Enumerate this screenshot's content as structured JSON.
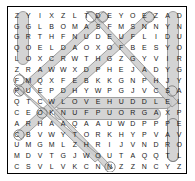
{
  "puzzle": {
    "type": "word-search",
    "rows": 15,
    "cols": 15,
    "grid": [
      [
        "Z",
        "Y",
        "I",
        "X",
        "Z",
        "L",
        "T",
        "D",
        "E",
        "Y",
        "O",
        "E",
        "Z",
        "A",
        "D"
      ],
      [
        "G",
        "G",
        "L",
        "B",
        "O",
        "M",
        "A",
        "S",
        "F",
        "M",
        "S",
        "N",
        "N",
        "Y",
        "N"
      ],
      [
        "G",
        "R",
        "T",
        "H",
        "F",
        "N",
        "U",
        "D",
        "E",
        "U",
        "F",
        "L",
        "I",
        "D",
        "U"
      ],
      [
        "Q",
        "O",
        "E",
        "L",
        "D",
        "A",
        "O",
        "X",
        "O",
        "F",
        "B",
        "E",
        "S",
        "Y",
        "O"
      ],
      [
        "L",
        "O",
        "X",
        "C",
        "R",
        "W",
        "T",
        "H",
        "G",
        "Z",
        "G",
        "Y",
        "V",
        "I",
        "R"
      ],
      [
        "Z",
        "R",
        "A",
        "W",
        "W",
        "X",
        "D",
        "P",
        "H",
        "E",
        "J",
        "A",
        "D",
        "Y",
        "G"
      ],
      [
        "F",
        "M",
        "Q",
        "X",
        "F",
        "E",
        "B",
        "K",
        "K",
        "G",
        "N",
        "P",
        "H",
        "J",
        "Y"
      ],
      [
        "P",
        "U",
        "E",
        "P",
        "D",
        "H",
        "Y",
        "W",
        "P",
        "G",
        "J",
        "V",
        "C",
        "S",
        "A"
      ],
      [
        "Q",
        "T",
        "C",
        "W",
        "L",
        "O",
        "V",
        "E",
        "H",
        "U",
        "D",
        "D",
        "L",
        "E",
        "L"
      ],
      [
        "C",
        "E",
        "O",
        "K",
        "N",
        "U",
        "F",
        "P",
        "U",
        "O",
        "R",
        "G",
        "A",
        "X",
        "P"
      ],
      [
        "A",
        "R",
        "H",
        "A",
        "A",
        "Q",
        "A",
        "A",
        "U",
        "W",
        "D",
        "P",
        "P",
        "P",
        "E"
      ],
      [
        "C",
        "B",
        "V",
        "W",
        "Y",
        "T",
        "O",
        "R",
        "K",
        "H",
        "Y",
        "P",
        "V",
        "A",
        "V"
      ],
      [
        "U",
        "M",
        "G",
        "M",
        "L",
        "Z",
        "H",
        "R",
        "I",
        "J",
        "V",
        "N",
        "D",
        "R",
        "O"
      ],
      [
        "M",
        "D",
        "V",
        "T",
        "G",
        "J",
        "W",
        "O",
        "U",
        "T",
        "A",
        "Q",
        "Q",
        "T",
        "L"
      ],
      [
        "C",
        "S",
        "V",
        "L",
        "V",
        "K",
        "C",
        "N",
        "N",
        "Z",
        "Z",
        "N",
        "C",
        "Y",
        "Z"
      ]
    ],
    "colors": {
      "highlight": "#c9c9c9",
      "highlight_stroke": "#8a8a8a",
      "letter": "#1a1a1a",
      "frame": "#000000",
      "background": "#ffffff"
    },
    "found_words": [
      {
        "word": "GROOVE",
        "direction": "down",
        "start_row": 0,
        "start_col": 1,
        "end_row": 4,
        "end_col": 1
      },
      {
        "word": "PLAYGROUND",
        "direction": "up",
        "start_row": 13,
        "start_col": 14,
        "end_row": 0,
        "end_col": 14
      },
      {
        "word": "LOVE",
        "direction": "up",
        "start_row": 13,
        "start_col": 14,
        "end_row": 10,
        "end_col": 14
      },
      {
        "word": "LOVE HUDDLE",
        "direction": "right",
        "start_row": 8,
        "start_col": 4,
        "end_row": 8,
        "end_col": 13
      },
      {
        "word": "GROUP FUN",
        "direction": "left",
        "start_row": 9,
        "start_col": 12,
        "end_row": 9,
        "end_col": 4
      },
      {
        "word": "DIAGONAL-1",
        "direction": "down-left",
        "start_row": 0,
        "start_col": 7,
        "end_row": 7,
        "end_col": 0
      },
      {
        "word": "DIAGONAL-2",
        "direction": "down-left",
        "start_row": 0,
        "start_col": 11,
        "end_row": 11,
        "end_col": 0
      },
      {
        "word": "DIAGONAL-3",
        "direction": "down-right",
        "start_row": 0,
        "start_col": 6,
        "end_row": 8,
        "end_col": 14
      },
      {
        "word": "DIAGONAL-4",
        "direction": "down-right",
        "start_row": 6,
        "start_col": 1,
        "end_row": 14,
        "end_col": 8
      },
      {
        "word": "DIAGONAL-5",
        "direction": "down-right",
        "start_row": 7,
        "start_col": 0,
        "end_row": 13,
        "end_col": 7
      }
    ]
  }
}
